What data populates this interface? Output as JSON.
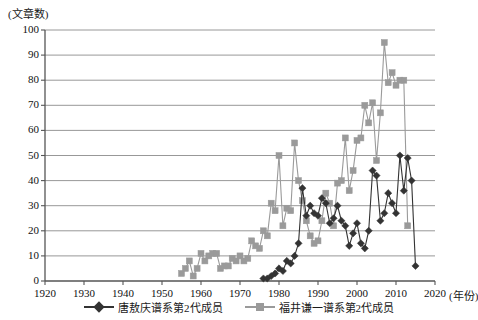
{
  "axis": {
    "y_title": "(文章数)",
    "x_unit": "(年份)",
    "y_ticks": [
      "0",
      "10",
      "20",
      "30",
      "40",
      "50",
      "60",
      "70",
      "80",
      "90",
      "100"
    ],
    "x_ticks": [
      "1920",
      "1930",
      "1940",
      "1950",
      "1960",
      "1970",
      "1980",
      "1990",
      "2000",
      "2010",
      "2020"
    ]
  },
  "legend": {
    "items": [
      {
        "label": "唐敖庆谱系第2代成员",
        "color": "#333333",
        "marker": "diamond"
      },
      {
        "label": "福井谦一谱系第2代成员",
        "color": "#9a9a9a",
        "marker": "square"
      }
    ]
  },
  "colors": {
    "series_dark": "#333333",
    "series_gray": "#9a9a9a",
    "grid": "#8c8c8c",
    "axis": "#555555",
    "background": "#ffffff"
  },
  "chart_data": {
    "type": "line",
    "title": "",
    "xlabel": "(年份)",
    "ylabel": "(文章数)",
    "xlim": [
      1920,
      2020
    ],
    "ylim": [
      0,
      100
    ],
    "xticks": [
      1920,
      1930,
      1940,
      1950,
      1960,
      1970,
      1980,
      1990,
      2000,
      2010,
      2020
    ],
    "yticks": [
      0,
      10,
      20,
      30,
      40,
      50,
      60,
      70,
      80,
      90,
      100
    ],
    "grid": "horizontal",
    "legend_position": "bottom",
    "series": [
      {
        "name": "福井谦一谱系第2代成员",
        "color": "#9a9a9a",
        "marker": "square",
        "points": [
          [
            1955,
            3
          ],
          [
            1956,
            5
          ],
          [
            1957,
            8
          ],
          [
            1958,
            2
          ],
          [
            1959,
            5
          ],
          [
            1960,
            11
          ],
          [
            1961,
            8
          ],
          [
            1962,
            10
          ],
          [
            1963,
            11
          ],
          [
            1964,
            11
          ],
          [
            1965,
            5
          ],
          [
            1966,
            6
          ],
          [
            1967,
            6
          ],
          [
            1968,
            9
          ],
          [
            1969,
            8
          ],
          [
            1970,
            10
          ],
          [
            1971,
            8
          ],
          [
            1972,
            9
          ],
          [
            1973,
            16
          ],
          [
            1974,
            14
          ],
          [
            1975,
            13
          ],
          [
            1976,
            20
          ],
          [
            1977,
            18
          ],
          [
            1978,
            31
          ],
          [
            1979,
            28
          ],
          [
            1980,
            50
          ],
          [
            1981,
            22
          ],
          [
            1982,
            29
          ],
          [
            1983,
            28
          ],
          [
            1984,
            55
          ],
          [
            1985,
            40
          ],
          [
            1986,
            32
          ],
          [
            1987,
            24
          ],
          [
            1988,
            18
          ],
          [
            1989,
            15
          ],
          [
            1990,
            16
          ],
          [
            1991,
            24
          ],
          [
            1992,
            35
          ],
          [
            1993,
            31
          ],
          [
            1994,
            22
          ],
          [
            1995,
            39
          ],
          [
            1996,
            40
          ],
          [
            1997,
            57
          ],
          [
            1998,
            36
          ],
          [
            1999,
            44
          ],
          [
            2000,
            56
          ],
          [
            2001,
            57
          ],
          [
            2002,
            70
          ],
          [
            2003,
            63
          ],
          [
            2004,
            71
          ],
          [
            2005,
            48
          ],
          [
            2006,
            67
          ],
          [
            2007,
            95
          ],
          [
            2008,
            79
          ],
          [
            2009,
            83
          ],
          [
            2010,
            78
          ],
          [
            2011,
            80
          ],
          [
            2012,
            80
          ],
          [
            2013,
            22
          ]
        ]
      },
      {
        "name": "唐敖庆谱系第2代成员",
        "color": "#333333",
        "marker": "diamond",
        "points": [
          [
            1976,
            1
          ],
          [
            1977,
            1
          ],
          [
            1978,
            2
          ],
          [
            1979,
            3
          ],
          [
            1980,
            5
          ],
          [
            1981,
            4
          ],
          [
            1982,
            8
          ],
          [
            1983,
            7
          ],
          [
            1984,
            10
          ],
          [
            1985,
            15
          ],
          [
            1986,
            37
          ],
          [
            1987,
            26
          ],
          [
            1988,
            30
          ],
          [
            1989,
            27
          ],
          [
            1990,
            26
          ],
          [
            1991,
            33
          ],
          [
            1992,
            31
          ],
          [
            1993,
            23
          ],
          [
            1994,
            25
          ],
          [
            1995,
            30
          ],
          [
            1996,
            24
          ],
          [
            1997,
            22
          ],
          [
            1998,
            14
          ],
          [
            1999,
            19
          ],
          [
            2000,
            23
          ],
          [
            2001,
            15
          ],
          [
            2002,
            13
          ],
          [
            2003,
            20
          ],
          [
            2004,
            44
          ],
          [
            2005,
            42
          ],
          [
            2006,
            24
          ],
          [
            2007,
            27
          ],
          [
            2008,
            35
          ],
          [
            2009,
            31
          ],
          [
            2010,
            27
          ],
          [
            2011,
            50
          ],
          [
            2012,
            36
          ],
          [
            2013,
            49
          ],
          [
            2014,
            40
          ],
          [
            2015,
            6
          ]
        ]
      }
    ]
  }
}
